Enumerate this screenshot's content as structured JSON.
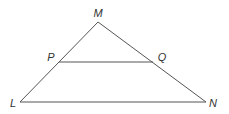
{
  "diagram": {
    "type": "triangle-with-midsegment",
    "stroke_color": "#555555",
    "label_color": "#333333",
    "vertices": {
      "M": {
        "label": "M",
        "x": 98,
        "y": 22,
        "lx": 98,
        "ly": 17
      },
      "L": {
        "label": "L",
        "x": 20,
        "y": 102,
        "lx": 13,
        "ly": 107
      },
      "N": {
        "label": "N",
        "x": 206,
        "y": 102,
        "lx": 213,
        "ly": 107
      },
      "P": {
        "label": "P",
        "x": 59,
        "y": 62,
        "lx": 51,
        "ly": 61
      },
      "Q": {
        "label": "Q",
        "x": 153,
        "y": 62,
        "lx": 162,
        "ly": 61
      }
    },
    "segments": [
      {
        "name": "segment-ML",
        "from": "M",
        "to": "L"
      },
      {
        "name": "segment-MN",
        "from": "M",
        "to": "N"
      },
      {
        "name": "segment-LN",
        "from": "L",
        "to": "N"
      },
      {
        "name": "segment-PQ",
        "from": "P",
        "to": "Q"
      }
    ]
  }
}
